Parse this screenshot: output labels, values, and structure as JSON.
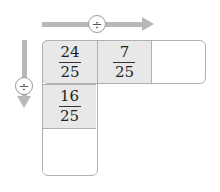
{
  "operators": {
    "horizontal": "÷",
    "vertical": "÷"
  },
  "icons": {
    "horizontal_arrow": "arrow-right-icon",
    "vertical_arrow": "arrow-down-icon",
    "operator": "divide-icon"
  },
  "colors": {
    "arrow": "#b8b8b8",
    "cell_filled": "#e8e8e8",
    "border": "#b0b0b0"
  },
  "grid": {
    "top_row": [
      {
        "numerator": "24",
        "denominator": "25"
      },
      {
        "numerator": "7",
        "denominator": "25"
      },
      {
        "numerator": "",
        "denominator": ""
      }
    ],
    "left_column": [
      {
        "numerator": "24",
        "denominator": "25"
      },
      {
        "numerator": "16",
        "denominator": "25"
      },
      {
        "numerator": "",
        "denominator": ""
      }
    ]
  }
}
